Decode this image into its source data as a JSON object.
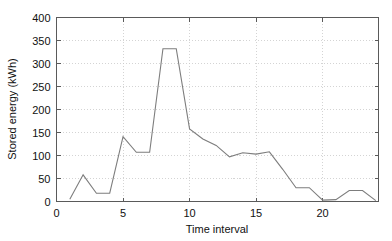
{
  "chart_data": {
    "type": "line",
    "title": "",
    "xlabel": "Time interval",
    "ylabel": "Stored energy (kWh)",
    "xlim": [
      0,
      24.2
    ],
    "ylim": [
      0,
      400
    ],
    "xticks": [
      0,
      5,
      10,
      15,
      20
    ],
    "yticks": [
      0,
      50,
      100,
      150,
      200,
      250,
      300,
      350,
      400
    ],
    "xticklabels": [
      "0",
      "5",
      "10",
      "15",
      "20"
    ],
    "yticklabels": [
      "0",
      "50",
      "100",
      "150",
      "200",
      "250",
      "300",
      "350",
      "400"
    ],
    "grid": true,
    "grid_style": "dotted",
    "legend": false,
    "line_color": "#7d7d7d",
    "axis_color": "#5a5a5a",
    "grid_color": "#c9c9c9",
    "background": "#ffffff",
    "x": [
      1,
      2,
      3,
      4,
      5,
      6,
      7,
      8,
      9,
      10,
      11,
      12,
      13,
      14,
      15,
      16,
      17,
      18,
      19,
      20,
      21,
      22,
      23,
      24
    ],
    "values": [
      5,
      58,
      18,
      18,
      141,
      107,
      107,
      332,
      332,
      158,
      136,
      122,
      97,
      106,
      103,
      108,
      70,
      30,
      30,
      3,
      4,
      24,
      24,
      2
    ],
    "series": [
      {
        "name": "Stored energy",
        "values": [
          5,
          58,
          18,
          18,
          141,
          107,
          107,
          332,
          332,
          158,
          136,
          122,
          97,
          106,
          103,
          108,
          70,
          30,
          30,
          3,
          4,
          24,
          24,
          2
        ]
      }
    ]
  }
}
